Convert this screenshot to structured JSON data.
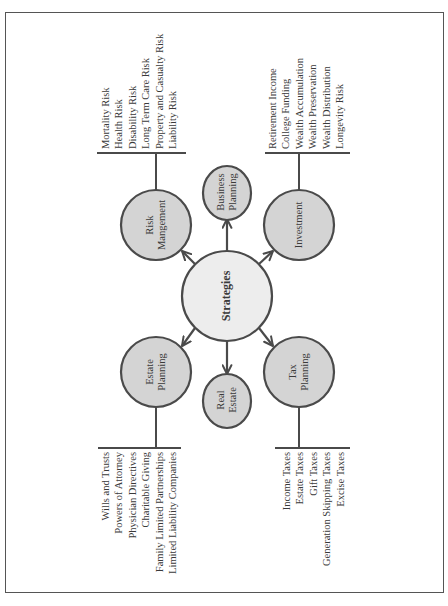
{
  "colors": {
    "frame": "#555555",
    "circle_stroke": "#4a4a4a",
    "circle_fill": "#d4d4d4",
    "center_fill": "#ededed",
    "line": "#4a4a4a",
    "text": "#3a3a3a"
  },
  "center": {
    "label": "Strategies"
  },
  "nodes": {
    "risk": {
      "line1": "Risk",
      "line2": "Mangement"
    },
    "business": {
      "line1": "Business",
      "line2": "Planning"
    },
    "investment": {
      "line1": "Investment"
    },
    "estate": {
      "line1": "Estate",
      "line2": "Planning"
    },
    "real_estate": {
      "line1": "Real",
      "line2": "Estate"
    },
    "tax": {
      "line1": "Tax",
      "line2": "Planning"
    }
  },
  "lists": {
    "risk": [
      "Mortality Risk",
      "Health Risk",
      "Disability Risk",
      "Long Term Care Risk",
      "Property and Casualty Risk",
      "Liability Risk"
    ],
    "investment": [
      "Retirement Income",
      "College Funding",
      "Wealth Accumulation",
      "Wealth Preservation",
      "Wealth Distribution",
      "Longevity Risk"
    ],
    "estate": [
      "Wills and Trusts",
      "Powers of Attorney",
      "Physician Directives",
      "Charitable Giving",
      "Family Limited Partnerships",
      "Limited Liability Companies"
    ],
    "tax": [
      "Income Taxes",
      "Estate Taxes",
      "Gift Taxes",
      "Generation Skipping Taxes",
      "Excise Taxes"
    ]
  }
}
